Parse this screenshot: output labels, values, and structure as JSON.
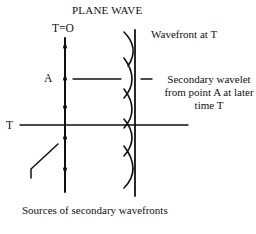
{
  "diagram": {
    "title": "PLANE WAVE",
    "labels": {
      "t_zero": "T=O",
      "point_a": "A",
      "time_t": "T",
      "wavefront": "Wavefront at T",
      "secondary_wavelet": "Secondary wavelet from point A at later time T",
      "sources": "Sources of secondary wavefronts"
    },
    "colors": {
      "line": "#111111",
      "background": "#ffffff"
    }
  }
}
